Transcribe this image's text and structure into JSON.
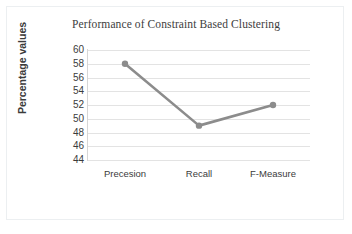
{
  "chart_data": {
    "type": "line",
    "title": "Performance of Constraint Based Clustering",
    "xlabel": "",
    "ylabel": "Percentage values",
    "categories": [
      "Precesion",
      "Recall",
      "F-Measure"
    ],
    "values": [
      58,
      49,
      52
    ],
    "series": [
      {
        "name": "Percentage values",
        "values": [
          58,
          49,
          52
        ]
      }
    ],
    "ylim": [
      44,
      60
    ],
    "yticks": [
      60,
      58,
      56,
      54,
      52,
      50,
      48,
      46,
      44
    ],
    "ytick_labels": [
      "60",
      "58",
      "56",
      "54",
      "52",
      "50",
      "48",
      "46",
      "44"
    ],
    "grid": true,
    "grid_axis": "y",
    "legend": false,
    "legend_position": "none",
    "marker": "circle",
    "colors": {
      "series_line": "#8c8c8c",
      "marker": "#8c8c8c",
      "gridline": "#e3e3e3",
      "axis_line": "#d6d6d6",
      "title_text": "#3d3d3d",
      "tick_text": "#3b3b3b",
      "frame_border": "#eceff1",
      "background": "#ffffff"
    }
  }
}
